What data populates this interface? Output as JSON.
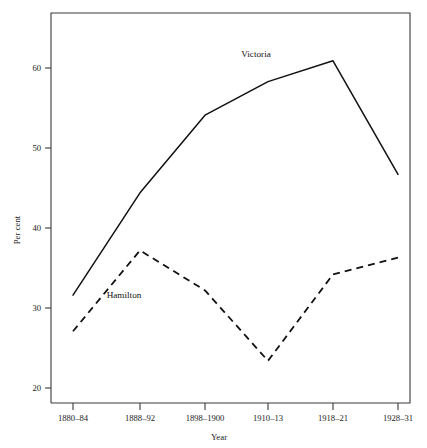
{
  "chart_data": {
    "type": "line",
    "title": "",
    "subtitle": "",
    "xlabel": "Year",
    "ylabel": "Per cent",
    "categories": [
      "1880–84",
      "1888–92",
      "1898–1900",
      "1910–13",
      "1918–21",
      "1928–31"
    ],
    "x_tick_labels": [
      "1880–84",
      "1888–92",
      "1898–1900",
      "1910–13",
      "1918–21",
      "1928–31"
    ],
    "y_tick_labels": [
      "20",
      "30",
      "40",
      "50",
      "60"
    ],
    "y_ticks": [
      20,
      30,
      40,
      50,
      60
    ],
    "ylim": [
      18.5,
      68.5
    ],
    "grid": false,
    "legend_position": "inline-annotations",
    "series": [
      {
        "name": "Victoria",
        "style": "solid",
        "values": [
          31.6,
          44.4,
          54.1,
          58.3,
          60.9,
          46.7
        ]
      },
      {
        "name": "Hamilton",
        "style": "dashed",
        "values": [
          27.1,
          37.2,
          32.2,
          23.4,
          34.2,
          36.3
        ]
      }
    ],
    "annotations": [
      {
        "text": "Victoria",
        "series": "Victoria",
        "x_px": 256,
        "y_px": 57
      },
      {
        "text": "Hamilton",
        "series": "Hamilton",
        "x_px": 124,
        "y_px": 298
      }
    ]
  },
  "axes": {
    "x_title": "Year",
    "y_title": "Per cent"
  }
}
